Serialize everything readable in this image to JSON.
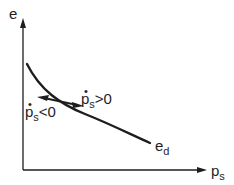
{
  "diagram": {
    "y_axis_label": "e",
    "x_axis_label": {
      "base": "p",
      "sub": "s"
    },
    "curve_label": {
      "base": "e",
      "sub": "d"
    },
    "arrow_right_label": {
      "base": "p",
      "dot": "•",
      "sub": "s",
      "rel": ">0"
    },
    "arrow_left_label": {
      "base": "p",
      "dot": "•",
      "sub": "s",
      "rel": "<0"
    },
    "colors": {
      "ink": "#1e1e1e",
      "background": "#ffffff"
    }
  }
}
